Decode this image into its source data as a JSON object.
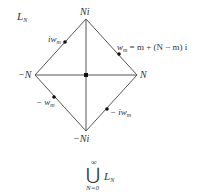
{
  "diagram": {
    "title": {
      "main": "L",
      "sub": "N"
    },
    "vertices": {
      "top": {
        "label": "Ni",
        "x": 86,
        "y": 19
      },
      "right": {
        "label": "N",
        "x": 137,
        "y": 75
      },
      "bottom": {
        "label": "−Ni",
        "x": 86,
        "y": 131
      },
      "left": {
        "label": "−N",
        "x": 35,
        "y": 75
      },
      "center": {
        "x": 86,
        "y": 75
      }
    },
    "points": [
      {
        "name": "iw_m",
        "label_main": "iw",
        "label_sub": "m",
        "x": 65,
        "y": 42
      },
      {
        "name": "w_m",
        "label_main": "w",
        "label_sub": "m",
        "x": 119,
        "y": 54
      },
      {
        "name": "-w_m",
        "label_main": "− w",
        "label_sub": "m",
        "x": 54,
        "y": 97
      },
      {
        "name": "-iw_m",
        "label_main": "− iw",
        "label_sub": "m",
        "x": 107,
        "y": 109
      }
    ],
    "equation": {
      "lhs_main": "w",
      "lhs_sub": "m",
      "rhs": "= m + (N − m) i"
    },
    "union": {
      "symbol": "⋃",
      "upper": "∞",
      "lower": "N=0",
      "term_main": "L",
      "term_sub": "N"
    },
    "colors": {
      "line": "#555555",
      "dot": "#111111",
      "text": "#333333"
    }
  }
}
